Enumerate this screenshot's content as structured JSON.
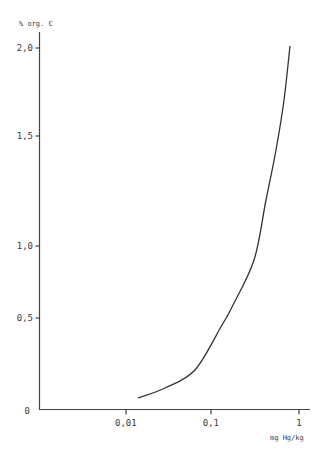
{
  "chart_data": {
    "type": "line",
    "title": "",
    "xlabel": "mg Hg/kg",
    "ylabel": "% org. C",
    "xscale": "log",
    "x_ticks": [
      {
        "value": 0.01,
        "label": "0,01",
        "px": 126
      },
      {
        "value": 0.1,
        "label": "0,1",
        "px": 211
      },
      {
        "value": 1,
        "label": "1",
        "px": 299
      }
    ],
    "y_ticks": [
      {
        "value": 0,
        "label": "0",
        "px": 409
      },
      {
        "value": 0.5,
        "label": "0,5",
        "px": 318
      },
      {
        "value": 1.0,
        "label": "1,0",
        "px": 246
      },
      {
        "value": 1.5,
        "label": "1,5",
        "px": 136
      },
      {
        "value": 2.0,
        "label": "2,0",
        "px": 48
      }
    ],
    "xlim": [
      0.001,
      1.3
    ],
    "ylim": [
      0,
      2.1
    ],
    "grid": false,
    "legend": null,
    "series": [
      {
        "name": "% org. C vs mg Hg/kg",
        "x": [
          0.0137,
          0.062,
          0.127,
          0.165,
          0.296,
          0.405,
          0.53,
          0.65,
          0.77
        ],
        "y": [
          0.06,
          0.21,
          0.46,
          0.59,
          0.9,
          1.21,
          1.44,
          1.7,
          2.01
        ],
        "px_points": [
          [
            138,
            398
          ],
          [
            165,
            388
          ],
          [
            195,
            370
          ],
          [
            222,
            325
          ],
          [
            232,
            307
          ],
          [
            254,
            260
          ],
          [
            266,
            200
          ],
          [
            276,
            150
          ],
          [
            284,
            100
          ],
          [
            290,
            46
          ]
        ]
      }
    ]
  },
  "labels": {
    "y_axis_title": "% org. C",
    "x_axis_unit": "mg Hg/kg",
    "origin": "0"
  },
  "colors": {
    "axis": "#444444",
    "curve": "#333333",
    "text": "#3a3a3a"
  }
}
